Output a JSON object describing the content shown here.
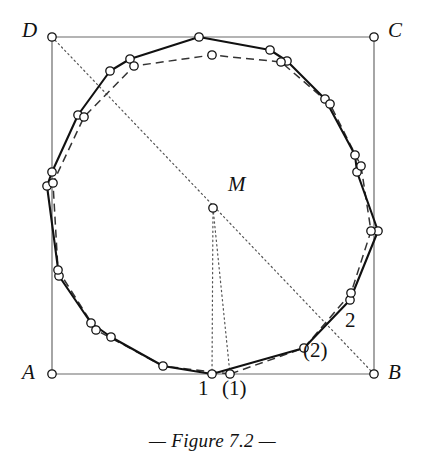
{
  "figure": {
    "caption": "— Figure 7.2 —",
    "square": {
      "corners": [
        {
          "name": "A",
          "label": "A",
          "x": 52,
          "y": 374,
          "label_x": 22,
          "label_y": 362
        },
        {
          "name": "B",
          "label": "B",
          "x": 374,
          "y": 374,
          "label_x": 388,
          "label_y": 362
        },
        {
          "name": "C",
          "label": "C",
          "x": 374,
          "y": 37,
          "label_x": 388,
          "label_y": 20
        },
        {
          "name": "D",
          "label": "D",
          "x": 52,
          "y": 37,
          "label_x": 22,
          "label_y": 20
        }
      ]
    },
    "center": {
      "name": "M",
      "label": "M",
      "x": 213,
      "y": 208,
      "label_x": 228,
      "label_y": 174
    },
    "point_labels": [
      {
        "name": "vertex-label-1",
        "label": "1",
        "x": 198,
        "y": 378,
        "italic": false
      },
      {
        "name": "vertex-label-1-paren",
        "label": "(1)",
        "x": 222,
        "y": 378,
        "italic": false
      },
      {
        "name": "vertex-label-2",
        "label": "2",
        "x": 345,
        "y": 310,
        "italic": false
      },
      {
        "name": "vertex-label-2-paren",
        "label": "(2)",
        "x": 303,
        "y": 340,
        "italic": false
      }
    ],
    "solid_polygon": {
      "name": "solid-polygon",
      "stroke": "#111111",
      "points": [
        [
          212,
          374
        ],
        [
          163,
          366
        ],
        [
          111,
          337
        ],
        [
          91,
          323
        ],
        [
          59,
          276
        ],
        [
          47,
          186
        ],
        [
          52,
          172
        ],
        [
          78,
          115
        ],
        [
          110,
          71
        ],
        [
          130,
          59
        ],
        [
          199,
          37
        ],
        [
          270,
          50
        ],
        [
          287,
          61
        ],
        [
          325,
          99
        ],
        [
          355,
          155
        ],
        [
          357,
          172
        ],
        [
          378,
          231
        ],
        [
          350,
          300
        ],
        [
          304,
          348
        ]
      ]
    },
    "dashed_polygon": {
      "name": "dashed-polygon",
      "stroke": "#333333",
      "points": [
        [
          230,
          374
        ],
        [
          163,
          366
        ],
        [
          96,
          330
        ],
        [
          58,
          270
        ],
        [
          53,
          183
        ],
        [
          84,
          117
        ],
        [
          134,
          66
        ],
        [
          212,
          55
        ],
        [
          281,
          62
        ],
        [
          330,
          104
        ],
        [
          361,
          166
        ],
        [
          371,
          231
        ],
        [
          351,
          293
        ],
        [
          304,
          348
        ]
      ]
    },
    "dotted_lines": [
      {
        "name": "diagonal-d-b",
        "x1": 52,
        "y1": 37,
        "x2": 374,
        "y2": 374
      },
      {
        "name": "radius-m-to-1",
        "x1": 213,
        "y1": 208,
        "x2": 212,
        "y2": 374
      },
      {
        "name": "radius-m-to-1-paren",
        "x1": 213,
        "y1": 208,
        "x2": 230,
        "y2": 374
      }
    ],
    "vertex_marker": {
      "radius": 4.2,
      "fill": "#ffffff",
      "stroke": "#111111"
    },
    "colors": {
      "line": "#111111",
      "square": "#6b6b6b",
      "dotted": "#555555",
      "background": "#ffffff"
    }
  }
}
